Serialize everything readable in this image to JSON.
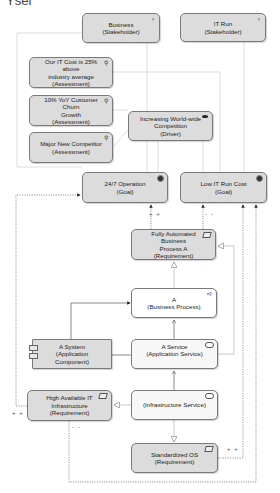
{
  "header": {
    "cut_text": "Ysel"
  },
  "nodes": {
    "business_stakeholder": {
      "name": "Business",
      "type": "(Stakeholder)"
    },
    "itrun_stakeholder": {
      "name": "IT Run",
      "type": "(Stakeholder)"
    },
    "assessment_itcost": {
      "name": "Our IT Cost is 25% above\nindustry average",
      "type": "(Assessment)"
    },
    "assessment_churn": {
      "name": "10% YoY Customer Churn\nGrowth",
      "type": "(Assessment)"
    },
    "assessment_competitor": {
      "name": "Major New Competitor",
      "type": "(Assessment)"
    },
    "driver_competition": {
      "name": "Increasing World-wide\nCompetition",
      "type": "(Driver)"
    },
    "goal_operation": {
      "name": "24/7 Operation",
      "type": "(Goal)"
    },
    "goal_lowcost": {
      "name": "Low IT Run Cost",
      "type": "(Goal)"
    },
    "req_automated": {
      "name": "Fully Automated Business\nProcess A",
      "type": "(Requirement)"
    },
    "business_process": {
      "name": "A",
      "type": "(Business Process)"
    },
    "app_component": {
      "name": "A System",
      "type": "(Application Component)"
    },
    "app_service": {
      "name": "A Service",
      "type": "(Application Service)"
    },
    "req_highavail": {
      "name": "High Available IT\nInfrastructure",
      "type": "(Requirement)"
    },
    "infra_service": {
      "name": "",
      "type": "(Infrastructure Service)"
    },
    "req_os": {
      "name": "Standardized OS",
      "type": "(Requirement)"
    }
  },
  "icons": {
    "stakeholder": "stakeholder-icon",
    "assessment": "assessment-icon",
    "driver": "driver-icon",
    "goal": "goal-icon",
    "requirement": "requirement-icon",
    "process": "process-icon",
    "service": "service-icon",
    "component": "component-icon"
  },
  "multiplicities": {
    "plus_operation": "+ +",
    "minus_lowcost": "- -",
    "plus_highavail": "+ +",
    "minus_highavail": "- -",
    "plus_os": "+ +"
  },
  "colors": {
    "motivation_fill": "#dcdcdc",
    "light_fill": "#f7f7f7",
    "border": "#7a7a7a",
    "line": "#cfcfcf",
    "dotted_line": "#666666"
  }
}
